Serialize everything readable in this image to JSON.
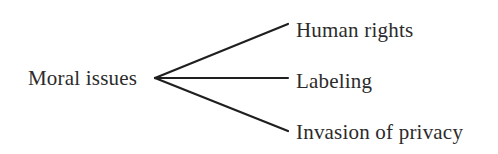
{
  "diagram": {
    "type": "tree-branch",
    "orientation": "left-to-right",
    "background_color": "#ffffff",
    "line_color": "#1f1f1f",
    "text_color": "#2b2b2b",
    "line_width_px": 2,
    "root": {
      "label": "Moral issues",
      "anchor_x": 155,
      "anchor_y": 78
    },
    "branches": [
      {
        "label": "Human rights",
        "end_x": 288,
        "end_y": 24
      },
      {
        "label": "Labeling",
        "end_x": 288,
        "end_y": 78
      },
      {
        "label": "Invasion of privacy",
        "end_x": 288,
        "end_y": 131
      }
    ]
  }
}
